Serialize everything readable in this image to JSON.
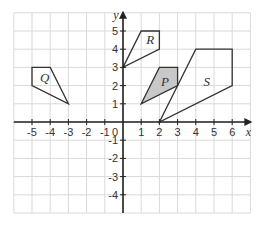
{
  "diagram": {
    "type": "coordinate-grid",
    "x_axis": {
      "label": "x",
      "min": -6,
      "max": 7,
      "ticks": [
        -5,
        -4,
        -3,
        -2,
        -1,
        1,
        2,
        3,
        4,
        5,
        6
      ]
    },
    "y_axis": {
      "label": "y",
      "min": -5,
      "max": 6,
      "ticks": [
        5,
        4,
        3,
        2,
        1,
        -1,
        -2,
        -3,
        -4
      ]
    },
    "origin_label": "0",
    "colors": {
      "grid": "#d9d9d9",
      "axis": "#222222",
      "outline": "#333333",
      "shaded_fill": "#c8c8c8"
    },
    "shapes": [
      {
        "name": "Q",
        "label": "Q",
        "shaded": false,
        "vertices": [
          [
            -5,
            3
          ],
          [
            -4,
            3
          ],
          [
            -3,
            1
          ],
          [
            -5,
            2
          ]
        ],
        "label_pos": [
          -4.3,
          2.2
        ]
      },
      {
        "name": "R",
        "label": "R",
        "shaded": false,
        "vertices": [
          [
            1,
            5
          ],
          [
            2,
            5
          ],
          [
            2,
            4
          ],
          [
            0,
            3
          ]
        ],
        "label_pos": [
          1.5,
          4.3
        ]
      },
      {
        "name": "P",
        "label": "P",
        "shaded": true,
        "vertices": [
          [
            2,
            3
          ],
          [
            3,
            3
          ],
          [
            3,
            2
          ],
          [
            1,
            1
          ]
        ],
        "label_pos": [
          2.3,
          2.0
        ]
      },
      {
        "name": "S",
        "label": "S",
        "shaded": false,
        "vertices": [
          [
            4,
            4
          ],
          [
            6,
            4
          ],
          [
            6,
            2
          ],
          [
            2,
            0
          ]
        ],
        "label_pos": [
          4.6,
          2.0
        ]
      }
    ]
  }
}
